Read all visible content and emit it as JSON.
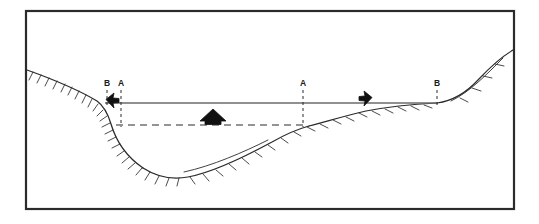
{
  "figure": {
    "type": "cross-section-diagram",
    "title": "",
    "background_color": "#ffffff",
    "border": {
      "color": "#2b2b2b",
      "x": 25,
      "y": 10,
      "width": 490,
      "height": 200,
      "stroke_width": 2.2
    },
    "line_color": "#2b2b2b",
    "hatch_color": "#2b2b2b",
    "fill_color": "#111111"
  },
  "labels": [
    {
      "id": "label-b-left",
      "text": "B",
      "x": 107,
      "y": 86
    },
    {
      "id": "label-a-left",
      "text": "A",
      "x": 121,
      "y": 86
    },
    {
      "id": "label-a-mid",
      "text": "A",
      "x": 303,
      "y": 86
    },
    {
      "id": "label-b-right",
      "text": "B",
      "x": 437,
      "y": 86
    }
  ],
  "section_lines": [
    {
      "id": "section-line-b-left",
      "label": "B",
      "x": 107,
      "y_top": 90,
      "y_bottom": 108,
      "style": "dashed"
    },
    {
      "id": "section-line-a-left",
      "label": "A",
      "x": 121,
      "y_top": 90,
      "y_bottom": 127,
      "style": "dashed"
    },
    {
      "id": "section-line-a-mid",
      "label": "A",
      "x": 303,
      "y_top": 90,
      "y_bottom": 127,
      "style": "dashed"
    },
    {
      "id": "section-line-b-right",
      "label": "B",
      "x": 437,
      "y_top": 90,
      "y_bottom": 106,
      "style": "dashed"
    }
  ],
  "water_surface": {
    "id": "water-surface-line",
    "style": "solid",
    "x_start": 105,
    "x_end": 438,
    "y": 103
  },
  "former_level": {
    "id": "former-level-line",
    "style": "dashed",
    "x_start": 116,
    "x_end": 303,
    "y": 125
  },
  "arrows": [
    {
      "id": "arrow-left",
      "direction": "left",
      "x": 113,
      "y": 100,
      "size": 11
    },
    {
      "id": "arrow-center",
      "direction": "up",
      "x": 213,
      "y": 119,
      "size": 20
    },
    {
      "id": "arrow-right",
      "direction": "right",
      "x": 366,
      "y": 98,
      "size": 11
    }
  ],
  "terrain": {
    "left_slope_id": "left-valley-wall",
    "valley_floor_id": "valley-floor",
    "right_bench_id": "right-bench-surface",
    "right_slope_id": "right-valley-wall",
    "hatching": "perpendicular tick marks on downslope side"
  }
}
